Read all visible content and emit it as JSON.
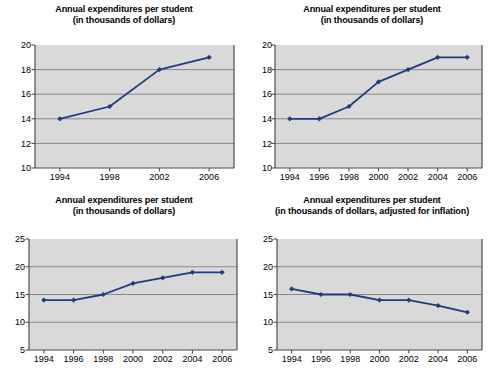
{
  "page": {
    "background_color": "#ffffff",
    "plot_background_color": "#d9d9d9",
    "series_color": "#1f3d7a",
    "gridline_color": "#808080",
    "axis_color": "#4d4d4d"
  },
  "charts": [
    {
      "id": "chart-top-left",
      "title_line1": "Annual expenditures per student",
      "title_line2": "(in thousands of dollars)",
      "chart_data": {
        "type": "line",
        "title": "Annual expenditures per student (in thousands of dollars)",
        "xlabel": "",
        "ylabel": "",
        "x": [
          "1994",
          "1998",
          "2002",
          "2006"
        ],
        "categories": [
          "1994",
          "1998",
          "2002",
          "2006"
        ],
        "values": [
          14,
          15,
          18,
          19
        ],
        "series": [
          {
            "name": "Annual expenditures per student",
            "values": [
              14,
              15,
              18,
              19
            ]
          }
        ],
        "xticks": [
          "1994",
          "1998",
          "2002",
          "2006"
        ],
        "yticks": [
          10,
          12,
          14,
          16,
          18,
          20
        ],
        "ylim": [
          10,
          20
        ],
        "grid": true,
        "legend": false,
        "marker": "diamond"
      }
    },
    {
      "id": "chart-top-right",
      "title_line1": "Annual expenditures per student",
      "title_line2": "(in thousands of dollars)",
      "chart_data": {
        "type": "line",
        "title": "Annual expenditures per student (in thousands of dollars)",
        "xlabel": "",
        "ylabel": "",
        "x": [
          "1994",
          "1996",
          "1998",
          "2000",
          "2002",
          "2004",
          "2006"
        ],
        "categories": [
          "1994",
          "1996",
          "1998",
          "2000",
          "2002",
          "2004",
          "2006"
        ],
        "values": [
          14,
          14,
          15,
          17,
          18,
          19,
          19
        ],
        "series": [
          {
            "name": "Annual expenditures per student",
            "values": [
              14,
              14,
              15,
              17,
              18,
              19,
              19
            ]
          }
        ],
        "xticks": [
          "1994",
          "1996",
          "1998",
          "2000",
          "2002",
          "2004",
          "2006"
        ],
        "yticks": [
          10,
          12,
          14,
          16,
          18,
          20
        ],
        "ylim": [
          10,
          20
        ],
        "grid": true,
        "legend": false,
        "marker": "diamond"
      }
    },
    {
      "id": "chart-bottom-left",
      "title_line1": "Annual expenditures per student",
      "title_line2": "(in thousands of dollars)",
      "chart_data": {
        "type": "line",
        "title": "Annual expenditures per student (in thousands of dollars)",
        "xlabel": "",
        "ylabel": "",
        "x": [
          "1994",
          "1996",
          "1998",
          "2000",
          "2002",
          "2004",
          "2006"
        ],
        "categories": [
          "1994",
          "1996",
          "1998",
          "2000",
          "2002",
          "2004",
          "2006"
        ],
        "values": [
          14,
          14,
          15,
          17,
          18,
          19,
          19
        ],
        "series": [
          {
            "name": "Annual expenditures per student",
            "values": [
              14,
              14,
              15,
              17,
              18,
              19,
              19
            ]
          }
        ],
        "xticks": [
          "1994",
          "1996",
          "1998",
          "2000",
          "2002",
          "2004",
          "2006"
        ],
        "yticks": [
          5,
          10,
          15,
          20,
          25
        ],
        "ylim": [
          5,
          25
        ],
        "grid": true,
        "legend": false,
        "marker": "diamond"
      }
    },
    {
      "id": "chart-bottom-right",
      "title_line1": "Annual expenditures per student",
      "title_line2": "(in thousands of dollars, adjusted for inflation)",
      "chart_data": {
        "type": "line",
        "title": "Annual expenditures per student (in thousands of dollars, adjusted for inflation)",
        "xlabel": "",
        "ylabel": "",
        "x": [
          "1994",
          "1996",
          "1998",
          "2000",
          "2002",
          "2004",
          "2006"
        ],
        "categories": [
          "1994",
          "1996",
          "1998",
          "2000",
          "2002",
          "2004",
          "2006"
        ],
        "values": [
          16,
          15,
          15,
          14,
          14,
          13,
          11.8
        ],
        "series": [
          {
            "name": "Annual expenditures per student, adjusted for inflation",
            "values": [
              16,
              15,
              15,
              14,
              14,
              13,
              11.8
            ]
          }
        ],
        "xticks": [
          "1994",
          "1996",
          "1998",
          "2000",
          "2002",
          "2004",
          "2006"
        ],
        "yticks": [
          5,
          10,
          15,
          20,
          25
        ],
        "ylim": [
          5,
          25
        ],
        "grid": true,
        "legend": false,
        "marker": "diamond"
      }
    }
  ]
}
